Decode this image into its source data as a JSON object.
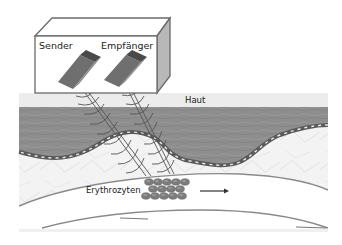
{
  "diagram": {
    "labels": {
      "sender": "Sender",
      "receiver": "Empfänger",
      "skin": "Haut",
      "erythrocytes": "Erythrozyten"
    },
    "colors": {
      "box_face": "#ffffff",
      "box_side": "#b8b8b8",
      "box_stroke": "#6a6a6a",
      "probe_dark": "#4e4e4e",
      "probe_mid": "#6f6f6f",
      "probe_light": "#8f8f8f",
      "skin_surface": "#ececec",
      "epidermis": "#8c8c8c",
      "dermis": "#f2f2f2",
      "vessel_wall": "#8a8a8a",
      "vessel_lumen": "#ffffff",
      "erythrocyte": "#7c7c7c",
      "wave": "#555555",
      "arrow": "#333333"
    },
    "erythrocyte_rows": [
      {
        "y": 182,
        "x": [
          149,
          158,
          167,
          176,
          185
        ]
      },
      {
        "y": 189,
        "x": [
          153,
          162,
          171,
          180
        ]
      },
      {
        "y": 196,
        "x": [
          146,
          155,
          164,
          173,
          182
        ]
      }
    ],
    "flow_arrow": {
      "x1": 200,
      "y1": 191,
      "x2": 228,
      "y2": 191
    }
  }
}
